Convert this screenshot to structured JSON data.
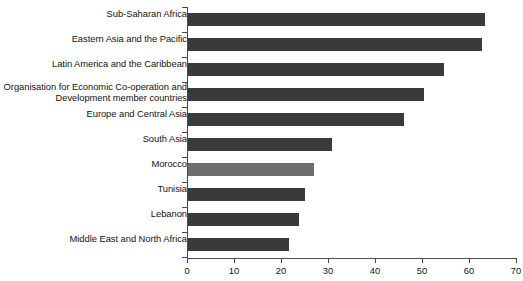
{
  "chart_data": {
    "type": "bar",
    "orientation": "horizontal",
    "title": "",
    "subtitle": "",
    "xlabel": "",
    "ylabel": "",
    "xlim": [
      0,
      70
    ],
    "xticks": [
      0,
      10,
      20,
      30,
      40,
      50,
      60,
      70
    ],
    "grid": false,
    "legend": null,
    "bar_color": "#3a3a3a",
    "highlight_color": "#6e6e6e",
    "categories": [
      "Sub-Saharan Africa",
      "Eastern Asia and the Pacific",
      "Latin America and the Caribbean",
      "Organisation for Economic Co-operation and Development member countries",
      "Europe and Central Asia",
      "South Asia",
      "Morocco",
      "Tunisia",
      "Lebanon",
      "Middle East and North Africa"
    ],
    "values": [
      63.4,
      62.7,
      54.7,
      50.4,
      46.1,
      30.9,
      27.0,
      25.2,
      23.8,
      21.7
    ],
    "highlighted_category": "Morocco",
    "bars": [
      {
        "label": "Sub-Saharan Africa",
        "value": 63.4,
        "highlight": false,
        "two_line": false
      },
      {
        "label": "Eastern Asia and the Pacific",
        "value": 62.7,
        "highlight": false,
        "two_line": false
      },
      {
        "label": "Latin America and the Caribbean",
        "value": 54.7,
        "highlight": false,
        "two_line": false
      },
      {
        "label": "Organisation for Economic Co-operation and Development member countries",
        "value": 50.4,
        "highlight": false,
        "two_line": true
      },
      {
        "label": "Europe and Central Asia",
        "value": 46.1,
        "highlight": false,
        "two_line": false
      },
      {
        "label": "South Asia",
        "value": 30.9,
        "highlight": false,
        "two_line": false
      },
      {
        "label": "Morocco",
        "value": 27.0,
        "highlight": true,
        "two_line": false
      },
      {
        "label": "Tunisia",
        "value": 25.2,
        "highlight": false,
        "two_line": false
      },
      {
        "label": "Lebanon",
        "value": 23.8,
        "highlight": false,
        "two_line": false
      },
      {
        "label": "Middle East and North Africa",
        "value": 21.7,
        "highlight": false,
        "two_line": false
      }
    ]
  }
}
